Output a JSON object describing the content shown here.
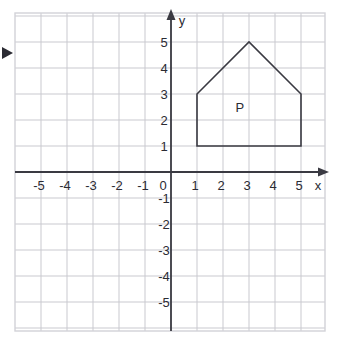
{
  "figure": {
    "title": "",
    "background_color": "#ffffff",
    "frame_color": "#d2d2d8",
    "grid_color": "#c9c9cf",
    "axis_color": "#3a3a42",
    "shape_stroke_color": "#3a3a42",
    "text_color": "#2b2b33"
  },
  "axes": {
    "x_label": "x",
    "y_label": "y",
    "origin_label": "0",
    "x_ticks": [
      "-5",
      "-4",
      "-3",
      "-2",
      "-1",
      "1",
      "2",
      "3",
      "4",
      "5"
    ],
    "y_ticks": [
      "5",
      "4",
      "3",
      "2",
      "1",
      "-1",
      "-2",
      "-3",
      "-4",
      "-5"
    ],
    "x_tick_values": [
      -5,
      -4,
      -3,
      -2,
      -1,
      1,
      2,
      3,
      4,
      5
    ],
    "y_tick_values": [
      5,
      4,
      3,
      2,
      1,
      -1,
      -2,
      -3,
      -4,
      -5
    ],
    "xlim": [
      -6,
      6
    ],
    "ylim": [
      -6,
      6
    ],
    "grid": true,
    "arrows": [
      "x-positive",
      "y-positive"
    ]
  },
  "shapes": [
    {
      "name": "P",
      "label": "P",
      "label_position": {
        "x": 2.65,
        "y": 2.3
      },
      "type": "polygon",
      "closed": true,
      "vertices": [
        {
          "x": 1,
          "y": 1
        },
        {
          "x": 5,
          "y": 1
        },
        {
          "x": 5,
          "y": 3
        },
        {
          "x": 3,
          "y": 5
        },
        {
          "x": 1,
          "y": 3
        }
      ]
    }
  ],
  "annotations": [
    {
      "name": "left-edge-arrow-marker",
      "type": "triangle-marker",
      "position": {
        "px_x": 2,
        "px_y": 47
      },
      "color": "#2b2b33"
    }
  ],
  "chart_data": {
    "type": "scatter",
    "title": "",
    "xlabel": "x",
    "ylabel": "y",
    "xlim": [
      -6,
      6
    ],
    "ylim": [
      -6,
      6
    ],
    "grid": true,
    "legend": "none",
    "x": [
      1,
      5,
      5,
      3,
      1
    ],
    "y": [
      1,
      1,
      3,
      5,
      3
    ],
    "series": [
      {
        "name": "P",
        "kind": "polygon",
        "points": [
          [
            1,
            1
          ],
          [
            5,
            1
          ],
          [
            5,
            3
          ],
          [
            3,
            5
          ],
          [
            1,
            3
          ]
        ]
      }
    ],
    "annotations": [
      {
        "text": "P",
        "x": 2.65,
        "y": 2.3
      }
    ]
  }
}
